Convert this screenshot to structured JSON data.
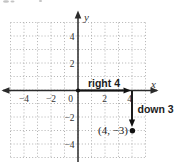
{
  "figure": {
    "x_axis_label": "x",
    "y_axis_label": "y",
    "x_tick_labels": [
      "−4",
      "−2",
      "0",
      "2",
      "4"
    ],
    "y_tick_labels": [
      "4",
      "2",
      "−2",
      "−4"
    ],
    "move_right_label": "right 4",
    "move_down_label": "down 3",
    "point_label": "(4, −3)",
    "colors": {
      "grid": "#a9a9a9",
      "axis": "#2b2b2b",
      "ink": "#111111",
      "text": "#333333"
    }
  },
  "chart_data": {
    "type": "scatter",
    "title": "",
    "xlabel": "x",
    "ylabel": "y",
    "xlim": [
      -5,
      5
    ],
    "ylim": [
      -5,
      5
    ],
    "x_ticks": [
      -4,
      -2,
      0,
      2,
      4
    ],
    "y_ticks": [
      -4,
      -2,
      2,
      4
    ],
    "grid": "dotted, 1-unit spacing",
    "points": [
      {
        "x": 4,
        "y": -3,
        "label": "(4, −3)"
      },
      {
        "x": 0,
        "y": 0,
        "label": "origin start dot"
      }
    ],
    "annotations": [
      {
        "type": "arrow",
        "from": [
          0,
          0
        ],
        "to": [
          4,
          0
        ],
        "label": "right 4"
      },
      {
        "type": "arrow",
        "from": [
          4,
          0
        ],
        "to": [
          4,
          -3
        ],
        "label": "down 3"
      }
    ]
  }
}
